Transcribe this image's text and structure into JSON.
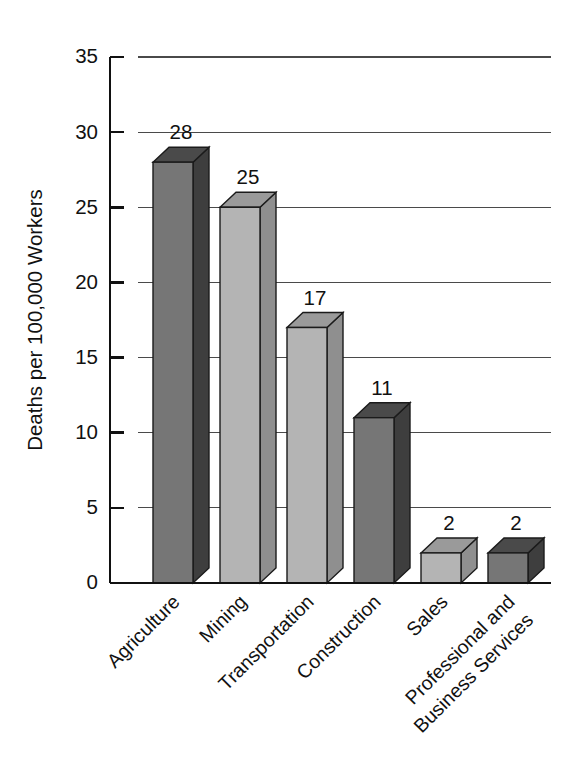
{
  "chart_data": {
    "type": "bar",
    "title": "",
    "subtitle": "",
    "xlabel": "",
    "ylabel": "Deaths per 100,000 Workers",
    "ylim": [
      0,
      35
    ],
    "ytick_step": 5,
    "ytick_labels": [
      "0",
      "5",
      "10",
      "15",
      "20",
      "25",
      "30",
      "35"
    ],
    "ytick_values": [
      0,
      5,
      10,
      15,
      20,
      25,
      30,
      35
    ],
    "grid": true,
    "grid_axis": "y",
    "legend": "none",
    "rendering": "3d-bars",
    "categories": [
      "Agriculture",
      "Mining",
      "Transportation",
      "Construction",
      "Sales",
      "Professional and Business Services"
    ],
    "category_label_lines": [
      [
        "Agriculture"
      ],
      [
        "Mining"
      ],
      [
        "Transportation"
      ],
      [
        "Construction"
      ],
      [
        "Sales"
      ],
      [
        "Professional and",
        "Business Services"
      ]
    ],
    "values": [
      28,
      25,
      17,
      11,
      2,
      2
    ],
    "value_labels": [
      "28",
      "25",
      "17",
      "11",
      "2",
      "2"
    ],
    "bar_colors": {
      "dark_face": "#767676",
      "dark_side": "#3e3e3e",
      "dark_top": "#4a4a4a",
      "light_face": "#b4b4b4",
      "light_side": "#8f8f8f",
      "light_top": "#9a9a9a",
      "outline": "#1b1b1b"
    },
    "bar_shades": [
      "dark",
      "light",
      "light",
      "dark",
      "light",
      "dark"
    ],
    "axis_color": "#111111",
    "grid_color": "#4a4a4a",
    "background": "#ffffff",
    "label_rotation_deg": -45
  },
  "figure": {
    "plot_left_px": 110,
    "plot_right_px": 551,
    "plot_top_px": 57,
    "plot_bottom_px": 583,
    "bar_front_width_px": 40,
    "bar_depth_x_px": 16,
    "bar_depth_y_px": 15,
    "bar_pitch_px": 67,
    "first_bar_left_px": 153
  }
}
